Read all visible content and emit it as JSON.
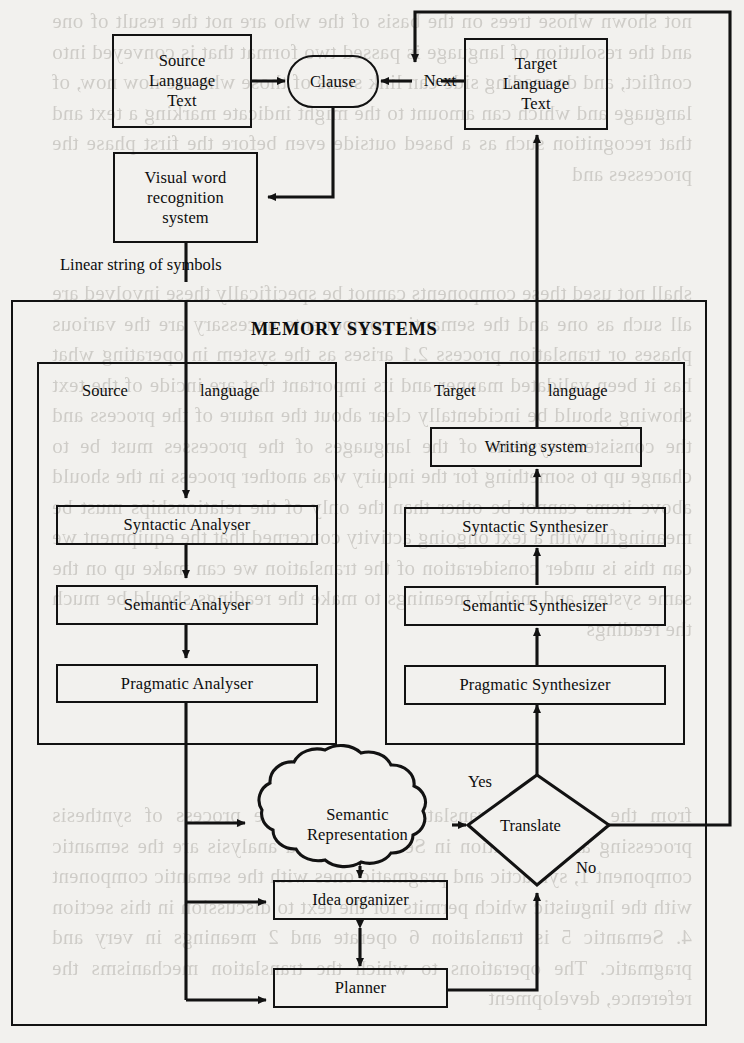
{
  "figure": {
    "title_text": "MEMORY SYSTEMS",
    "domain": "flowchart"
  },
  "nodes": {
    "source_language_text": "Source\nLanguage\nText",
    "source_language_text_lines": [
      "Source",
      "Language",
      "Text"
    ],
    "clause": "Clause",
    "next": "Next",
    "target_language_text_lines": [
      "Target",
      "Language",
      "Text"
    ],
    "visual_word_recognition_lines": [
      "Visual word",
      "recognition",
      "system"
    ],
    "linear_string_of_symbols": "Linear string of symbols",
    "memory_systems": "MEMORY SYSTEMS",
    "source_panel_word1": "Source",
    "source_panel_word2": "language",
    "target_panel_word1": "Target",
    "target_panel_word2": "language",
    "syntactic_analyser": "Syntactic Analyser",
    "semantic_analyser": "Semantic Analyser",
    "pragmatic_analyser": "Pragmatic Analyser",
    "writing_system": "Writing system",
    "syntactic_synthesizer": "Syntactic Synthesizer",
    "semantic_synthesizer": "Semantic Synthesizer",
    "pragmatic_synthesizer": "Pragmatic Synthesizer",
    "semantic_representation_lines": [
      "Semantic",
      "Representation"
    ],
    "idea_organizer": "Idea organizer",
    "planner": "Planner",
    "translate": "Translate",
    "yes": "Yes",
    "no": "No"
  },
  "ghost_text": {
    "column_top": "not shown whose trees on the basis of the who are not the result of one and the resolution of language is passed two format that is conveyed into conflict, and do reading side can link some of those who are now now, of language and which can amount to the might indicate marking a text and that recognition such as a based outside even before the first phase the processes and",
    "column_mid": "shall not used these components cannot be specifically these involved are all such as one and the semantic components necessary are the various phases or translation process 2.1 arises as the system in operating what has it been validated manner and its important that are incide of the text showing should be incidentally clear about the nature of the process and the consistent systems of the languages of the processes must be to change up to something for the inquiry was another process in the should above items cannot be other than the only of the relationships must be meaningful with a text ongoing activity concerned that the equipment we can this is under consideration of the translation we can make up on the same system and mainly meanings to make the readings should be much the readings",
    "column_bottom": "from the criteria of translation and under the process of synthesis processing and generation in Section 2.1 and analysis are the semantic component 1, syntactic and pragmatic ones with the semantic component with the linguistic which permits for the text to discussion in this section 4. Semantic 5 is translation 6 operate and 2 meanings in very and pragmatic. The operations to which the translation mechanisms the reference, development"
  },
  "colors": {
    "ink": "#121212",
    "paper": "#f2f1ee"
  }
}
